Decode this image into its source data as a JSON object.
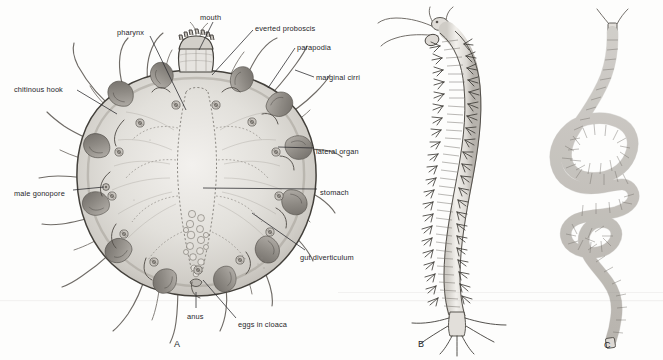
{
  "plate": {
    "background_color": "#fdfdfc",
    "ink_color": "#26262a",
    "body_fill": "#d9d7d3",
    "body_fill_light": "#eceae6",
    "parapodia_fill": "#a9a5a0",
    "description": "Anatomical plate of a polychaete annelid worm: A ventral view of a short rounded-body form with everted proboscis, B whole elongate segmented worm, C long coiled slender worm"
  },
  "figures": [
    {
      "id": "A",
      "letter": "A",
      "x": 174,
      "y": 340,
      "caption": "ventral view of body with everted proboscis"
    },
    {
      "id": "B",
      "letter": "B",
      "x": 418,
      "y": 340,
      "caption": "entire segmented worm, lateral"
    },
    {
      "id": "C",
      "letter": "C",
      "x": 604,
      "y": 341,
      "caption": "elongate coiled worm"
    }
  ],
  "labels": [
    {
      "id": "pharynx",
      "text": "pharynx",
      "x": 117,
      "y": 29,
      "align": "left",
      "leader": [
        [
          150,
          36
        ],
        [
          186,
          110
        ]
      ]
    },
    {
      "id": "mouth",
      "text": "mouth",
      "x": 200,
      "y": 14,
      "align": "left",
      "leader": [
        [
          213,
          22
        ],
        [
          199,
          50
        ]
      ]
    },
    {
      "id": "everted-proboscis",
      "text": "everted proboscis",
      "x": 255,
      "y": 25,
      "align": "left",
      "leader": [
        [
          253,
          30
        ],
        [
          212,
          75
        ]
      ]
    },
    {
      "id": "parapodia",
      "text": "parapodia",
      "x": 297,
      "y": 44,
      "align": "left",
      "leader": [
        [
          295,
          48
        ],
        [
          268,
          88
        ]
      ]
    },
    {
      "id": "marginal-cirri",
      "text": "marginal cirri",
      "x": 316,
      "y": 74,
      "align": "left",
      "leader": [
        [
          314,
          77
        ],
        [
          295,
          70
        ]
      ]
    },
    {
      "id": "chitinous-hook",
      "text": "chitinous hook",
      "x": 14,
      "y": 86,
      "align": "left",
      "leader": [
        [
          77,
          90
        ],
        [
          117,
          114
        ]
      ]
    },
    {
      "id": "lateral-organ",
      "text": "lateral organ",
      "x": 316,
      "y": 148,
      "align": "left",
      "leader": [
        [
          314,
          148
        ],
        [
          278,
          147
        ]
      ]
    },
    {
      "id": "male-gonopore",
      "text": "male gonopore",
      "x": 14,
      "y": 190,
      "align": "left",
      "leader": [
        [
          73,
          190
        ],
        [
          104,
          187
        ]
      ]
    },
    {
      "id": "stomach",
      "text": "stomach",
      "x": 320,
      "y": 189,
      "align": "left",
      "leader": [
        [
          317,
          189
        ],
        [
          203,
          188
        ]
      ]
    },
    {
      "id": "gut-diverticulum",
      "text": "gut diverticulum",
      "x": 300,
      "y": 254,
      "align": "left",
      "leader": [
        [
          305,
          250
        ],
        [
          252,
          213
        ]
      ]
    },
    {
      "id": "anus",
      "text": "anus",
      "x": 187,
      "y": 313,
      "align": "left",
      "leader": [
        [
          196,
          308
        ],
        [
          196,
          292
        ]
      ]
    },
    {
      "id": "eggs-in-cloaca",
      "text": "eggs in cloaca",
      "x": 238,
      "y": 321,
      "align": "left",
      "leader": [
        [
          236,
          318
        ],
        [
          203,
          280
        ]
      ]
    }
  ]
}
